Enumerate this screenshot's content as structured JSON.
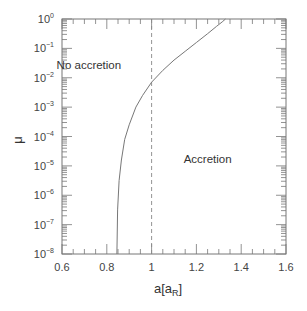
{
  "chart_data": {
    "type": "line",
    "title": "",
    "xlabel": "a[a_R]",
    "xlabel_main": "a[a",
    "xlabel_sub": "R",
    "xlabel_close": "]",
    "ylabel": "μ",
    "xlim": [
      0.6,
      1.6
    ],
    "ylim": [
      1e-08,
      1
    ],
    "yscale": "log",
    "grid": false,
    "x_ticks": [
      "0.6",
      "0.8",
      "1",
      "1.2",
      "1.4",
      "1.6"
    ],
    "y_ticks": [
      {
        "base": "10",
        "exp": "0"
      },
      {
        "base": "10",
        "exp": "−1"
      },
      {
        "base": "10",
        "exp": "−2"
      },
      {
        "base": "10",
        "exp": "−3"
      },
      {
        "base": "10",
        "exp": "−4"
      },
      {
        "base": "10",
        "exp": "−5"
      },
      {
        "base": "10",
        "exp": "−6"
      },
      {
        "base": "10",
        "exp": "−7"
      },
      {
        "base": "10",
        "exp": "−8"
      }
    ],
    "series": [
      {
        "name": "accretion boundary",
        "style": "solid",
        "x": [
          0.845,
          0.848,
          0.855,
          0.865,
          0.88,
          0.9,
          0.93,
          0.96,
          1.0,
          1.05,
          1.1,
          1.15,
          1.2,
          1.25,
          1.29,
          1.315,
          1.33
        ],
        "log10_y": [
          -8,
          -6.5,
          -5.5,
          -4.8,
          -4.1,
          -3.6,
          -3.0,
          -2.6,
          -2.15,
          -1.75,
          -1.4,
          -1.1,
          -0.8,
          -0.5,
          -0.25,
          -0.1,
          0
        ]
      },
      {
        "name": "a = 1 reference",
        "style": "dashed",
        "x": [
          1.0,
          1.0
        ],
        "log10_y": [
          -8,
          0
        ]
      }
    ],
    "annotations": [
      {
        "text": "No accretion",
        "x": 0.72,
        "log10_y": -1.7
      },
      {
        "text": "Accretion",
        "x": 1.25,
        "log10_y": -4.9
      }
    ]
  }
}
